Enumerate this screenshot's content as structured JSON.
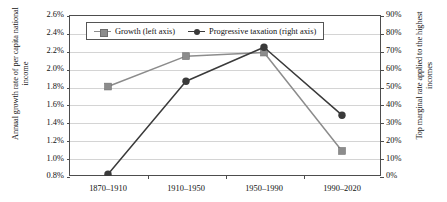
{
  "chart_data": {
    "type": "line",
    "title": "",
    "xlabel": "",
    "categories": [
      "1870–1910",
      "1910–1950",
      "1950–1990",
      "1990–2020"
    ],
    "series": [
      {
        "name": "Growth (left axis)",
        "axis": "left",
        "marker": "square",
        "color": "#8c8c8c",
        "values": [
          1.8,
          2.14,
          2.18,
          1.08
        ],
        "unit": "%"
      },
      {
        "name": "Progressive taxation (right axis)",
        "axis": "right",
        "marker": "circle",
        "color": "#3a3a3a",
        "values": [
          1,
          53,
          72,
          34
        ],
        "unit": "%"
      }
    ],
    "left_axis": {
      "label": "Annual growth rate of per capita national income",
      "ylim": [
        0.8,
        2.6
      ],
      "tick_step": 0.2,
      "ticks": [
        "0.8%",
        "1.0%",
        "1.2%",
        "1.4%",
        "1.6%",
        "1.8%",
        "2.0%",
        "2.2%",
        "2.4%",
        "2.6%"
      ]
    },
    "right_axis": {
      "label": "Top marginal rate applied to the highest incomes",
      "ylim": [
        0,
        90
      ],
      "tick_step": 10,
      "ticks": [
        "0%",
        "10%",
        "20%",
        "30%",
        "40%",
        "50%",
        "60%",
        "70%",
        "80%",
        "90%"
      ]
    },
    "grid": true,
    "legend_position": "top-center"
  },
  "legend": {
    "growth_label": "Growth (left axis)",
    "tax_label": "Progressive taxation (right axis)"
  }
}
